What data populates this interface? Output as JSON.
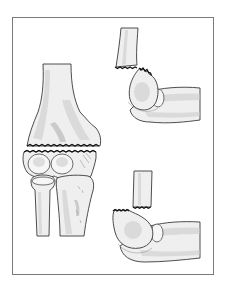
{
  "figure": {
    "frame_color": "#7a7a7a",
    "background": "#ffffff",
    "panels": [
      {
        "name": "anterior-view",
        "description": "front view of distal humerus with transverse fracture above condyles, radius and ulna below"
      },
      {
        "name": "lateral-view-displaced",
        "description": "side view showing humeral shaft fragment separated above the elbow joint with forearm bones"
      },
      {
        "name": "lateral-view-aligned",
        "description": "side view showing humeral shaft above condyle with forearm bones, fracture gap"
      }
    ]
  }
}
